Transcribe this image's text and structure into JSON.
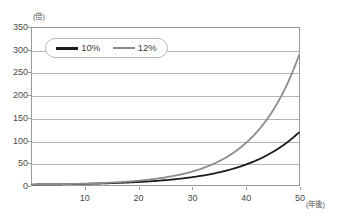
{
  "chart_data": {
    "type": "line",
    "title": "",
    "xlabel": "(年後)",
    "ylabel": "(倍)",
    "xlim": [
      0,
      50
    ],
    "ylim": [
      0,
      350
    ],
    "grid": true,
    "legend_position": "top-left inside plot",
    "x_ticks": [
      "10",
      "20",
      "30",
      "40",
      "50"
    ],
    "x_tick_values": [
      10,
      20,
      30,
      40,
      50
    ],
    "y_ticks": [
      "0",
      "50",
      "100",
      "150",
      "200",
      "250",
      "300",
      "350"
    ],
    "y_tick_values": [
      0,
      50,
      100,
      150,
      200,
      250,
      300,
      350
    ],
    "x": [
      0,
      5,
      10,
      15,
      20,
      25,
      30,
      35,
      40,
      45,
      50
    ],
    "series": [
      {
        "name": "10%",
        "color": "#1c1c1c",
        "values": [
          1,
          1.6,
          2.6,
          4.2,
          6.7,
          10.8,
          17.4,
          28.1,
          45.3,
          72.9,
          117.4
        ]
      },
      {
        "name": "12%",
        "color": "#8c8c8c",
        "values": [
          1,
          1.8,
          3.1,
          5.5,
          9.6,
          17.0,
          30.0,
          52.8,
          93.1,
          163.9,
          289.0
        ]
      }
    ]
  },
  "legend": {
    "entries": [
      {
        "label": "10%",
        "swatch_name": "legend-swatch-10"
      },
      {
        "label": "12%",
        "swatch_name": "legend-swatch-12"
      }
    ]
  },
  "axes": {
    "y_unit": "(倍)",
    "x_unit": "(年後)"
  }
}
